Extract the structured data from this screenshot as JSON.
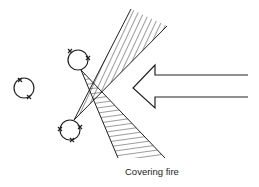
{
  "diagram": {
    "label": "Covering fire",
    "colors": {
      "stroke": "#222222",
      "background": "#ffffff"
    },
    "elements": [
      {
        "type": "circle",
        "name": "isolated-unit",
        "cx": 24,
        "cy": 88,
        "r": 10
      },
      {
        "type": "circle",
        "name": "upper-unit",
        "cx": 78,
        "cy": 60,
        "r": 10
      },
      {
        "type": "circle",
        "name": "lower-unit",
        "cx": 70,
        "cy": 130,
        "r": 10
      },
      {
        "type": "wedge",
        "name": "upper-fire-sector",
        "hatch": "diagonal"
      },
      {
        "type": "wedge",
        "name": "lower-fire-sector",
        "hatch": "horizontal"
      },
      {
        "type": "arrow",
        "name": "enemy-advance-arrow",
        "direction": "left"
      }
    ]
  }
}
